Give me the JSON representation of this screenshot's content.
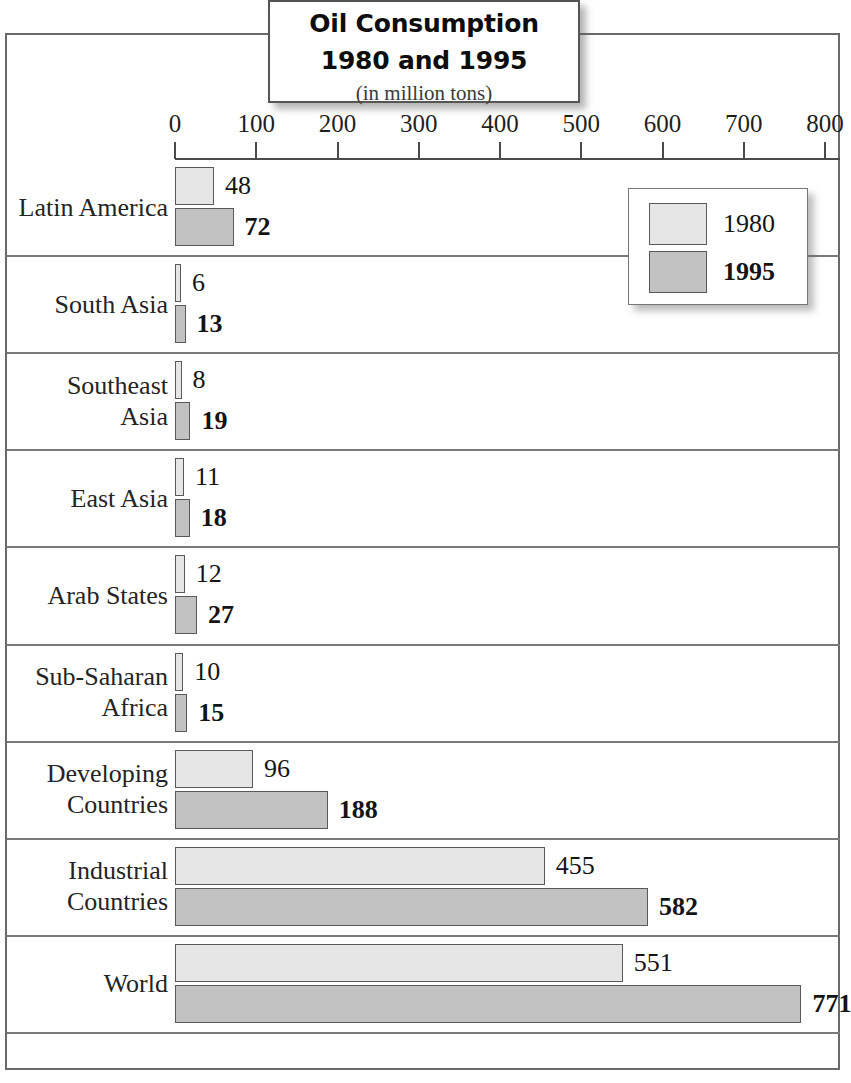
{
  "title": {
    "line1": "Oil Consumption",
    "line2": "1980 and 1995",
    "subtitle": "(in million tons)"
  },
  "legend": {
    "items": [
      {
        "label": "1980",
        "color": "#e6e6e6"
      },
      {
        "label": "1995",
        "color": "#c2c2c2"
      }
    ]
  },
  "axis": {
    "ticks": [
      "0",
      "100",
      "200",
      "300",
      "400",
      "500",
      "600",
      "700",
      "800"
    ]
  },
  "chart_data": {
    "type": "bar",
    "orientation": "horizontal",
    "title": "Oil Consumption 1980 and 1995",
    "subtitle": "(in million tons)",
    "xlabel": "",
    "ylabel": "",
    "xlim": [
      0,
      800
    ],
    "xticks": [
      0,
      100,
      200,
      300,
      400,
      500,
      600,
      700,
      800
    ],
    "grid": true,
    "legend_position": "top-right",
    "categories": [
      "Latin America",
      "South Asia",
      "Southeast\nAsia",
      "East Asia",
      "Arab States",
      "Sub-Saharan\nAfrica",
      "Developing\nCountries",
      "Industrial\nCountries",
      "World"
    ],
    "series": [
      {
        "name": "1980",
        "color": "#e6e6e6",
        "values": [
          48,
          6,
          8,
          11,
          12,
          10,
          96,
          455,
          551
        ]
      },
      {
        "name": "1995",
        "color": "#c2c2c2",
        "values": [
          72,
          13,
          19,
          18,
          27,
          15,
          188,
          582,
          771
        ]
      }
    ]
  }
}
